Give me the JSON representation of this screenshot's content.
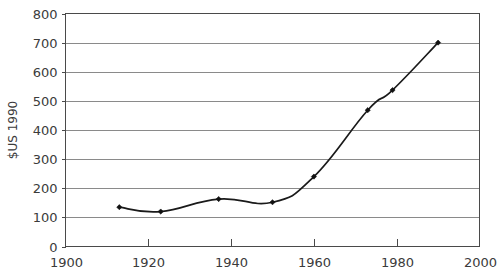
{
  "chart_data": {
    "type": "line",
    "title": "",
    "xlabel": "",
    "ylabel": "$US 1990",
    "xlim": [
      1900,
      2000
    ],
    "ylim": [
      0,
      800
    ],
    "grid": true,
    "legend": "none",
    "x_ticks": [
      1900,
      1920,
      1940,
      1960,
      1980,
      2000
    ],
    "x_tick_labels": [
      "1900",
      "1920",
      "1940",
      "1960",
      "1980",
      "2000"
    ],
    "y_ticks": [
      0,
      100,
      200,
      300,
      400,
      500,
      600,
      700,
      800
    ],
    "y_tick_labels": [
      "0",
      "100",
      "200",
      "300",
      "400",
      "500",
      "600",
      "700",
      "800"
    ],
    "x": [
      1913,
      1923,
      1937,
      1950,
      1960,
      1973,
      1979,
      1990
    ],
    "values": [
      135,
      120,
      163,
      152,
      240,
      468,
      537,
      700
    ],
    "series": [
      {
        "name": "$US 1990",
        "x": [
          1913,
          1923,
          1937,
          1950,
          1960,
          1973,
          1979,
          1990
        ],
        "values": [
          135,
          120,
          163,
          152,
          240,
          468,
          537,
          700
        ],
        "color": "#111111",
        "marker": "diamond",
        "smooth": true
      }
    ]
  },
  "colors": {
    "line": "#111111",
    "grid": "#8a8a8a",
    "axis": "#4a4a4a",
    "text": "#3b3b3b",
    "background": "#ffffff"
  }
}
